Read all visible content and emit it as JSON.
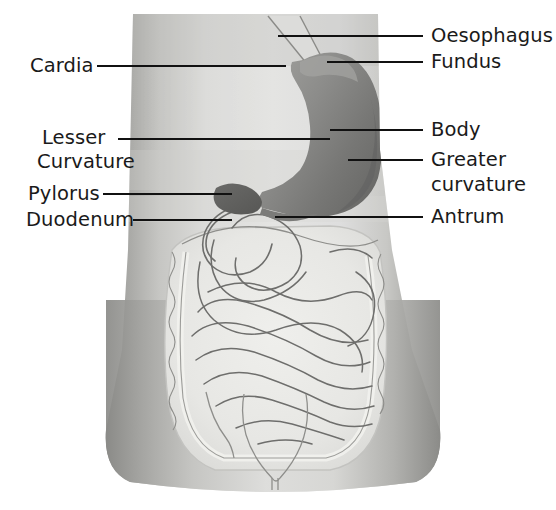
{
  "figure": {
    "canvas": {
      "width": 556,
      "height": 510,
      "background": "#ffffff"
    }
  },
  "palette": {
    "background": "#ffffff",
    "torso_light": "#e3e3e1",
    "torso_mid": "#c9c9c6",
    "torso_shadow": "#9a9a97",
    "torso_edge_dark": "#8d8d8a",
    "stomach_fill": "#8e8e8c",
    "stomach_dark": "#6f6f6d",
    "stomach_highlight": "#a8a8a5",
    "intestine_outline": "#6e6e6c",
    "intestine_pale": "#ededea",
    "leader_line": "#111111",
    "label_text": "#1a1a1a"
  },
  "labels": {
    "left": [
      {
        "id": "cardia",
        "text": "Cardia",
        "x": 30,
        "y": 56,
        "line_x1": 97,
        "line_x2": 286,
        "line_y": 66
      },
      {
        "id": "lesser-curvature",
        "text": "Lesser",
        "x": 42,
        "y": 128,
        "line_x1": 118,
        "line_x2": 330,
        "line_y": 139
      },
      {
        "id": "lesser-curvature-2",
        "text": "Curvature",
        "x": 37,
        "y": 152,
        "line_x1": null,
        "line_x2": null,
        "line_y": null
      },
      {
        "id": "pylorus",
        "text": "Pylorus",
        "x": 28,
        "y": 184,
        "line_x1": 103,
        "line_x2": 232,
        "line_y": 194
      },
      {
        "id": "duodenum",
        "text": "Duodenum",
        "x": 26,
        "y": 210,
        "line_x1": 133,
        "line_x2": 232,
        "line_y": 220
      }
    ],
    "right": [
      {
        "id": "oesophagus",
        "text": "Oesophagus",
        "x": 431,
        "y": 26,
        "line_x1": 278,
        "line_x2": 423,
        "line_y": 36
      },
      {
        "id": "fundus",
        "text": "Fundus",
        "x": 431,
        "y": 52,
        "line_x1": 327,
        "line_x2": 423,
        "line_y": 62
      },
      {
        "id": "body",
        "text": "Body",
        "x": 431,
        "y": 120,
        "line_x1": 330,
        "line_x2": 423,
        "line_y": 130
      },
      {
        "id": "greater-curvature",
        "text": "Greater",
        "x": 431,
        "y": 150,
        "line_x1": 348,
        "line_x2": 423,
        "line_y": 160
      },
      {
        "id": "greater-curvature-2",
        "text": "curvature",
        "x": 431,
        "y": 175,
        "line_x1": null,
        "line_x2": null,
        "line_y": null
      },
      {
        "id": "antrum",
        "text": "Antrum",
        "x": 431,
        "y": 207,
        "line_x1": 275,
        "line_x2": 423,
        "line_y": 217
      }
    ]
  },
  "structures": [
    {
      "name": "oesophagus",
      "description": "thin tube descending from upper torso into the cardia"
    },
    {
      "name": "cardia",
      "description": "junction where oesophagus meets stomach"
    },
    {
      "name": "fundus",
      "description": "dome at the upper-left of the stomach body"
    },
    {
      "name": "body",
      "description": "main central chamber of the stomach"
    },
    {
      "name": "greater-curvature",
      "description": "long convex outer border on the right"
    },
    {
      "name": "lesser-curvature",
      "description": "short concave inner border on the left"
    },
    {
      "name": "antrum",
      "description": "lower narrowing portion before the pylorus"
    },
    {
      "name": "pylorus",
      "description": "dark bulb at the stomach outlet"
    },
    {
      "name": "duodenum",
      "description": "C-shaped tube leaving the pylorus"
    },
    {
      "name": "small-intestine",
      "description": "coiled loops filling the central abdomen"
    },
    {
      "name": "large-intestine",
      "description": "pale frame surrounding the small bowel"
    },
    {
      "name": "bladder",
      "description": "outline at the lower pelvis"
    }
  ]
}
